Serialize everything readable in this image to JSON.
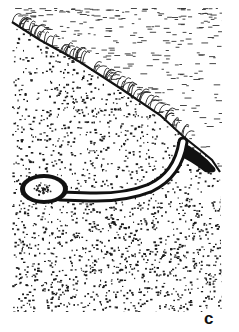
{
  "figure": {
    "panel_label": "c",
    "elements": [
      {
        "name": "air-region",
        "style": "sparse horizontal hatching"
      },
      {
        "name": "grass-surface",
        "style": "diagonal grass tufts along slope"
      },
      {
        "name": "soil-region",
        "style": "dense stippling"
      },
      {
        "name": "burrow-tunnel",
        "style": "white tunnel with dark outline"
      },
      {
        "name": "burrow-chamber",
        "style": "oval chamber with nest material"
      },
      {
        "name": "burrow-entrance-mound",
        "style": "dark mound at tunnel opening"
      }
    ],
    "colors": {
      "ink": "#111111",
      "paper": "#ffffff"
    }
  }
}
